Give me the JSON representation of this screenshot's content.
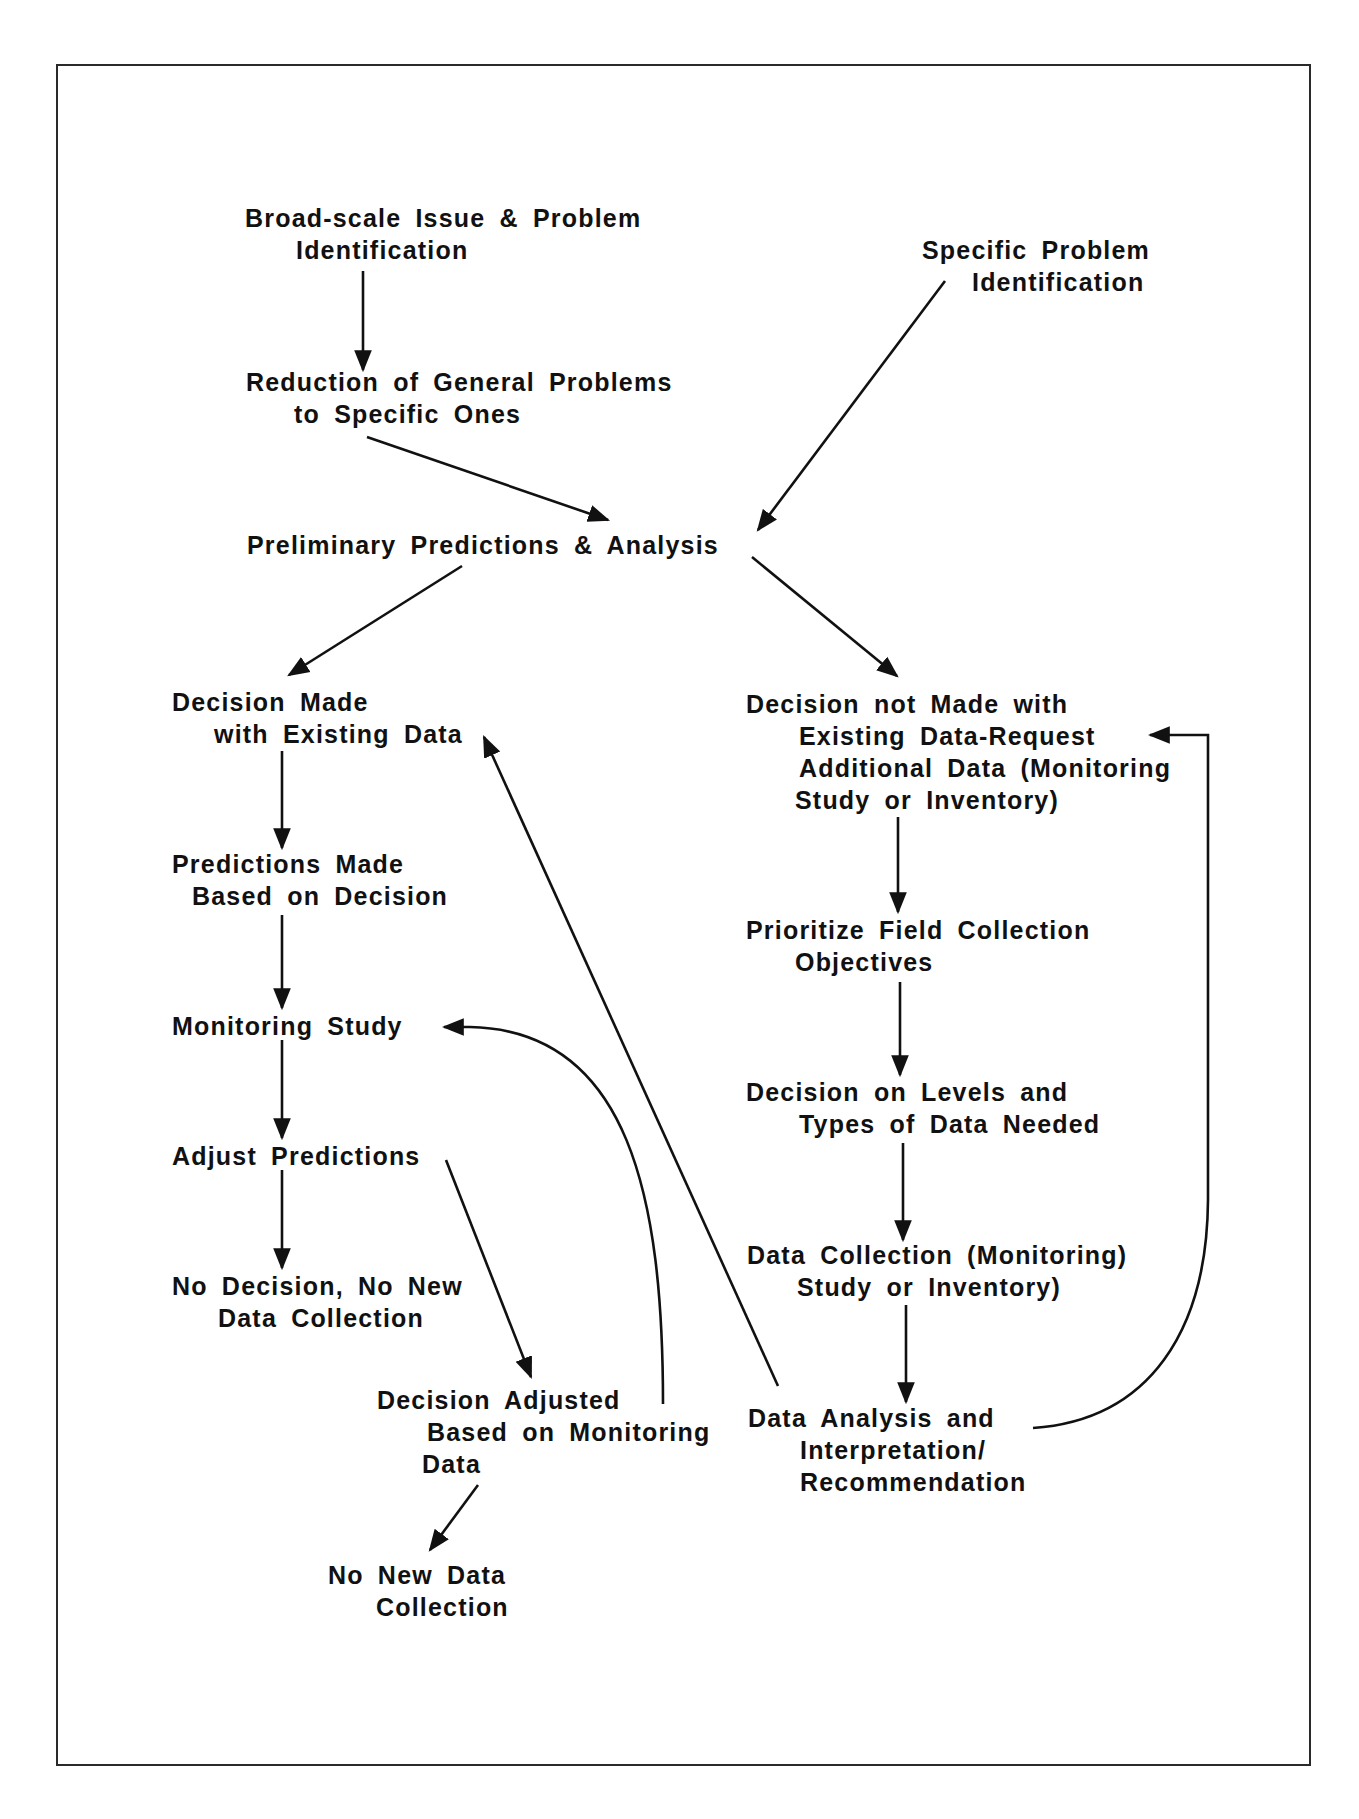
{
  "diagram": {
    "type": "flowchart",
    "colors": {
      "ink": "#111111",
      "background": "#ffffff",
      "frame": "#2a2a2a"
    },
    "nodes": {
      "broad_scale": {
        "lines": [
          "Broad-scale Issue & Problem",
          "Identification"
        ]
      },
      "reduction": {
        "lines": [
          "Reduction of General Problems",
          "to Specific Ones"
        ]
      },
      "specific_problem": {
        "lines": [
          "Specific Problem",
          "Identification"
        ]
      },
      "preliminary": {
        "lines": [
          "Preliminary Predictions & Analysis"
        ]
      },
      "decision_made": {
        "lines": [
          "Decision Made",
          "with Existing Data"
        ]
      },
      "decision_not_made": {
        "lines": [
          "Decision not Made with",
          "Existing Data-Request",
          "Additional Data (Monitoring",
          "Study or Inventory)"
        ]
      },
      "predictions_made": {
        "lines": [
          "Predictions Made",
          "Based on Decision"
        ]
      },
      "prioritize": {
        "lines": [
          "Prioritize Field Collection",
          "Objectives"
        ]
      },
      "monitoring_study": {
        "lines": [
          "Monitoring Study"
        ]
      },
      "decision_levels": {
        "lines": [
          "Decision on Levels and",
          "Types of Data Needed"
        ]
      },
      "adjust_predictions": {
        "lines": [
          "Adjust Predictions"
        ]
      },
      "no_decision": {
        "lines": [
          "No Decision, No New",
          "Data Collection"
        ]
      },
      "data_collection": {
        "lines": [
          "Data Collection (Monitoring)",
          "Study or Inventory)"
        ]
      },
      "decision_adjusted": {
        "lines": [
          "Decision Adjusted",
          "Based on Monitoring",
          "Data"
        ]
      },
      "data_analysis": {
        "lines": [
          "Data Analysis and",
          "Interpretation/",
          "Recommendation"
        ]
      },
      "no_new_data": {
        "lines": [
          "No New Data",
          "Collection"
        ]
      }
    },
    "edges": [
      {
        "from": "broad_scale",
        "to": "reduction"
      },
      {
        "from": "reduction",
        "to": "preliminary"
      },
      {
        "from": "specific_problem",
        "to": "preliminary"
      },
      {
        "from": "preliminary",
        "to": "decision_made"
      },
      {
        "from": "preliminary",
        "to": "decision_not_made"
      },
      {
        "from": "decision_made",
        "to": "predictions_made"
      },
      {
        "from": "predictions_made",
        "to": "monitoring_study"
      },
      {
        "from": "monitoring_study",
        "to": "adjust_predictions"
      },
      {
        "from": "adjust_predictions",
        "to": "no_decision"
      },
      {
        "from": "adjust_predictions",
        "to": "decision_adjusted"
      },
      {
        "from": "decision_adjusted",
        "to": "monitoring_study",
        "style": "curved"
      },
      {
        "from": "decision_adjusted",
        "to": "no_new_data"
      },
      {
        "from": "decision_not_made",
        "to": "prioritize"
      },
      {
        "from": "prioritize",
        "to": "decision_levels"
      },
      {
        "from": "decision_levels",
        "to": "data_collection"
      },
      {
        "from": "data_collection",
        "to": "data_analysis"
      },
      {
        "from": "data_analysis",
        "to": "decision_made"
      },
      {
        "from": "data_analysis",
        "to": "decision_not_made",
        "style": "curved"
      }
    ]
  }
}
